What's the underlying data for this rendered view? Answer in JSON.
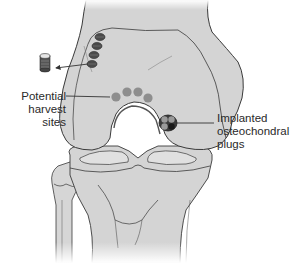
{
  "figure": {
    "colors": {
      "bone_fill": "#d4d4d4",
      "bone_fill_light": "#e2e2e2",
      "outline": "#3a3a3a",
      "harvest_site": "#8e8e8e",
      "donor_hole": "#4a4a4a",
      "plug_dark": "#222222",
      "text": "#2a2a2a",
      "background": "#ffffff"
    }
  },
  "labels": {
    "harvest": {
      "lines": [
        "Potential",
        "harvest",
        "sites"
      ]
    },
    "implanted": {
      "lines": [
        "Implanted",
        "osteochondral",
        "plugs"
      ]
    }
  },
  "elements": {
    "donor_holes_count": 4,
    "harvest_sites_count": 4,
    "implanted_plugs_count": 4
  }
}
